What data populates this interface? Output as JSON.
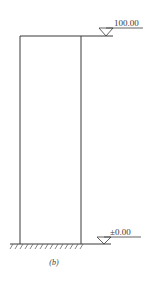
{
  "diagram": {
    "caption": "(b)",
    "elevations": {
      "top": {
        "label": "100.00"
      },
      "bottom": {
        "label": "±0.00"
      }
    },
    "colors": {
      "line": "#3a3a3a",
      "hatch": "#555555",
      "background": "#ffffff"
    }
  }
}
